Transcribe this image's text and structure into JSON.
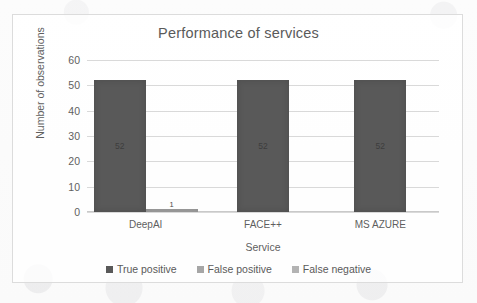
{
  "chart_data": {
    "type": "bar",
    "title": "Performance of services",
    "xlabel": "Service",
    "ylabel": "Number of observations",
    "categories": [
      "DeepAI",
      "FACE++",
      "MS AZURE"
    ],
    "series": [
      {
        "name": "True positive",
        "values": [
          52,
          52,
          52
        ],
        "color": "#595959"
      },
      {
        "name": "False positive",
        "values": [
          1,
          0,
          0
        ],
        "color": "#a6a6a6"
      },
      {
        "name": "False negative",
        "values": [
          0,
          0,
          0
        ],
        "color": "#b3b3b3"
      }
    ],
    "data_labels": [
      {
        "category": "DeepAI",
        "series": "True positive",
        "text": "52"
      },
      {
        "category": "DeepAI",
        "series": "False positive",
        "text": "1"
      },
      {
        "category": "FACE++",
        "series": "True positive",
        "text": "52"
      },
      {
        "category": "MS AZURE",
        "series": "True positive",
        "text": "52"
      }
    ],
    "ylim": [
      0,
      60
    ],
    "yticks": [
      0,
      10,
      20,
      30,
      40,
      50,
      60
    ],
    "ytick_labels": [
      "0",
      "10",
      "20",
      "30",
      "40",
      "50",
      "60"
    ],
    "grid": true,
    "grid_axis": "y",
    "legend_position": "bottom",
    "legend": [
      "True positive",
      "False positive",
      "False negative"
    ]
  },
  "colors": {
    "true_positive": "#595959",
    "false_positive": "#a6a6a6",
    "false_negative": "#b3b3b3",
    "gridline": "#d9d9d9",
    "text": "#5a5a5a",
    "border": "#dcdcdc"
  }
}
